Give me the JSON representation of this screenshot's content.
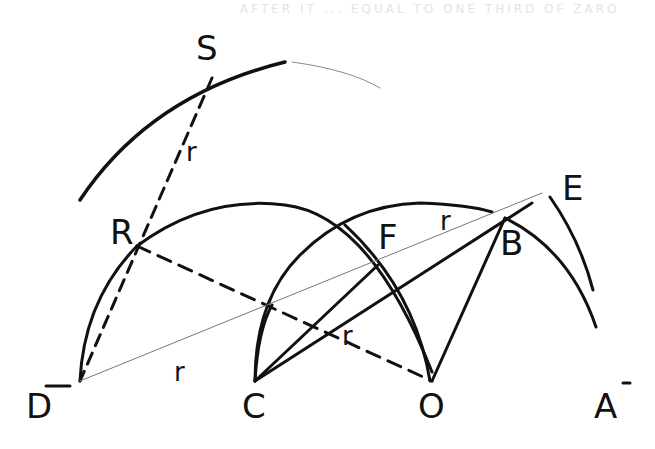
{
  "diagram": {
    "faint_header_text": "AFTER IT ... EQUAL TO ONE THIRD OF ZARO",
    "points": {
      "S": {
        "label": "S",
        "x": 212,
        "y": 78
      },
      "R": {
        "label": "R",
        "x": 137,
        "y": 246
      },
      "F": {
        "label": "F",
        "x": 380,
        "y": 262
      },
      "E": {
        "label": "E",
        "x": 542,
        "y": 193
      },
      "B": {
        "label": "B",
        "x": 505,
        "y": 218
      },
      "D": {
        "label": "D",
        "x": 80,
        "y": 381
      },
      "C": {
        "label": "C",
        "x": 255,
        "y": 381
      },
      "O": {
        "label": "O",
        "x": 432,
        "y": 381
      },
      "A": {
        "label": "A",
        "x": 600,
        "y": 381
      }
    },
    "labels": {
      "S": "S",
      "R": "R",
      "F": "F",
      "E": "E",
      "B": "B",
      "D": "D",
      "C": "C",
      "O": "O",
      "A": "A",
      "r_SR": "r",
      "r_FB": "r",
      "r_CF": "r",
      "r_DC": "r",
      "bar_D": "—",
      "bar_A": "-"
    },
    "colors": {
      "ink": "#111111",
      "faint": "#9a9a9a",
      "background": "#ffffff"
    }
  }
}
